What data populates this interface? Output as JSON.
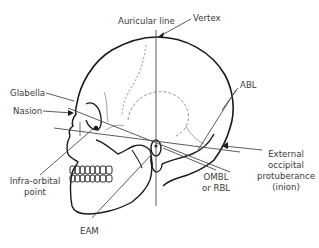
{
  "diagram": {
    "colors": {
      "background": "#ffffff",
      "outline": "#1a1a1a",
      "leader_line": "#4a4a4a",
      "label_text": "#3a3a3a"
    },
    "labels": {
      "auricular_line": "Auricular line",
      "vertex": "Vertex",
      "glabella": "Glabella",
      "nasion": "Nasion",
      "abl": "ABL",
      "infra_orbital_line1": "Infra-orbital",
      "infra_orbital_line2": "point",
      "eam": "EAM",
      "ombl_line1": "OMBL",
      "ombl_line2": "or RBL",
      "eop_line1": "External",
      "eop_line2": "occipital",
      "eop_line3": "protuberance",
      "eop_line4": "(inion)"
    }
  }
}
